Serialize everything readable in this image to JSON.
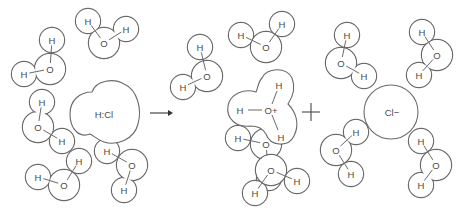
{
  "figure": {
    "arrow_label": "",
    "plus_sign": "+"
  },
  "atoms": {
    "hydrogen": "H",
    "oxygen": "O",
    "hydronium_oxygen": "O+",
    "hcl": "H:Cl",
    "chloride": "Cl−"
  },
  "reactants": {
    "water_molecules": [
      {
        "id": "w1",
        "H1": [
          52,
          40
        ],
        "O": [
          50,
          69
        ],
        "H2": [
          24,
          74
        ]
      },
      {
        "id": "w2",
        "H1": [
          88,
          21
        ],
        "O": [
          104,
          43
        ],
        "H2": [
          126,
          29
        ]
      },
      {
        "id": "w3",
        "H1": [
          42,
          102
        ],
        "O": [
          38,
          127
        ],
        "H2": [
          62,
          141
        ]
      },
      {
        "id": "w4",
        "H1": [
          38,
          177
        ],
        "O": [
          64,
          185
        ],
        "H2": [
          79,
          161
        ]
      },
      {
        "id": "w5",
        "H1": [
          107,
          151
        ],
        "O": [
          132,
          165
        ],
        "H2": [
          124,
          190
        ]
      }
    ],
    "hcl": {
      "label": "H:Cl"
    }
  },
  "products": {
    "water_molecules": [
      {
        "id": "w6",
        "H1": [
          200,
          47
        ],
        "O": [
          207,
          76
        ],
        "H2": [
          183,
          87
        ]
      },
      {
        "id": "w7",
        "H1": [
          241,
          35
        ],
        "O": [
          266,
          47
        ],
        "H2": [
          282,
          24
        ]
      },
      {
        "id": "w8",
        "H1": [
          238,
          138
        ],
        "O": [
          266,
          144
        ],
        "H2": [
          269,
          178
        ]
      },
      {
        "id": "w9",
        "H1": [
          297,
          181
        ],
        "O": [
          271,
          170
        ],
        "H2": [
          255,
          193
        ]
      },
      {
        "id": "w10",
        "H1": [
          347,
          35
        ],
        "O": [
          341,
          63
        ],
        "H2": [
          364,
          76
        ]
      },
      {
        "id": "w11",
        "H1": [
          422,
          32
        ],
        "O": [
          437,
          55
        ],
        "H2": [
          419,
          75
        ]
      },
      {
        "id": "w12",
        "H1": [
          356,
          132
        ],
        "O": [
          336,
          150
        ],
        "H2": [
          351,
          174
        ]
      },
      {
        "id": "w13",
        "H1": [
          421,
          141
        ],
        "O": [
          436,
          165
        ],
        "H2": [
          421,
          185
        ]
      }
    ],
    "hydronium": {
      "label": "O+",
      "H_atoms": 3
    },
    "chloride": {
      "label": "Cl−"
    }
  }
}
